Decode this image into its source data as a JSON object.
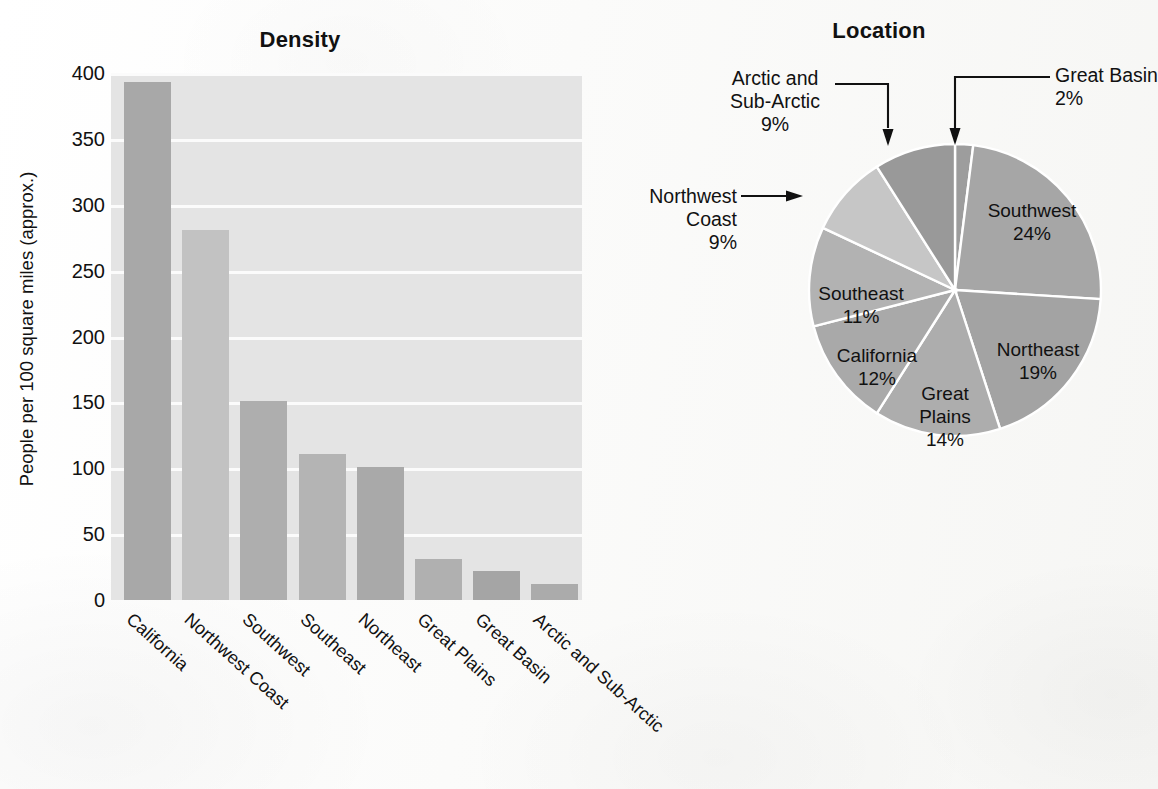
{
  "chart_data": [
    {
      "type": "bar",
      "title": "Density",
      "xlabel": "",
      "ylabel": "People per 100 square miles (approx.)",
      "ylim": [
        0,
        400
      ],
      "yticks": [
        0,
        50,
        100,
        150,
        200,
        250,
        300,
        350,
        400
      ],
      "ytick_labels": [
        "0",
        "50",
        "100",
        "150",
        "200",
        "250",
        "300",
        "350",
        "400"
      ],
      "grid": "horizontal-white",
      "legend": "none",
      "categories": [
        "California",
        "Northwest Coast",
        "Southwest",
        "Southeast",
        "Northeast",
        "Great Plains",
        "Great Basin",
        "Arctic and Sub-Arctic"
      ],
      "values": [
        393,
        281,
        151,
        111,
        101,
        31,
        22,
        12
      ],
      "bar_colors": [
        "#a8a8a8",
        "#c2c2c2",
        "#aeaeae",
        "#b4b4b4",
        "#a9a9a9",
        "#b0b0b0",
        "#a5a5a5",
        "#ababab"
      ],
      "plot_background": "#e4e4e4",
      "gridline_color": "#fbfbfb"
    },
    {
      "type": "pie",
      "title": "Location",
      "start_angle_deg": 0,
      "direction": "clockwise",
      "labels": [
        "Great Basin",
        "Southwest",
        "Northeast",
        "Great Plains",
        "California",
        "Southeast",
        "Northwest Coast",
        "Arctic and Sub-Arctic"
      ],
      "values": [
        2,
        24,
        19,
        14,
        12,
        11,
        9,
        9
      ],
      "value_labels": [
        "2%",
        "24%",
        "19%",
        "14%",
        "12%",
        "11%",
        "9%",
        "9%"
      ],
      "slice_colors": [
        "#9d9d9d",
        "#a6a6a6",
        "#a3a3a3",
        "#adadad",
        "#a9a9a9",
        "#b2b2b2",
        "#c6c6c6",
        "#999999"
      ],
      "separator_color": "#ffffff",
      "inside_labels": [
        "Southwest",
        "Northeast",
        "Great Plains",
        "California",
        "Southeast"
      ],
      "callout_labels": [
        "Great Basin",
        "Arctic and Sub-Arctic",
        "Northwest Coast"
      ]
    }
  ],
  "bar_chart": {
    "title": "Density",
    "ylabel": "People per 100 square miles (approx.)",
    "yticks": [
      "400",
      "350",
      "300",
      "250",
      "200",
      "150",
      "100",
      "50",
      "0"
    ],
    "categories": [
      "California",
      "Northwest Coast",
      "Southwest",
      "Southeast",
      "Northeast",
      "Great Plains",
      "Great Basin",
      "Arctic and Sub-Arctic"
    ]
  },
  "pie_chart": {
    "title": "Location",
    "slices": [
      {
        "label": "Great Basin",
        "percent": "2%",
        "value": 2
      },
      {
        "label": "Southwest",
        "percent": "24%",
        "value": 24
      },
      {
        "label": "Northeast",
        "percent": "19%",
        "value": 19
      },
      {
        "label": "Great Plains",
        "percent": "14%",
        "value": 14
      },
      {
        "label": "California",
        "percent": "12%",
        "value": 12
      },
      {
        "label": "Southeast",
        "percent": "11%",
        "value": 11
      },
      {
        "label": "Northwest Coast",
        "percent": "9%",
        "value": 9
      },
      {
        "label": "Arctic and Sub-Arctic",
        "percent": "9%",
        "value": 9
      }
    ],
    "callouts": {
      "great_basin": {
        "line1": "Great Basin",
        "line2": "2%"
      },
      "arctic": {
        "line1": "Arctic and",
        "line2": "Sub-Arctic",
        "line3": "9%"
      },
      "northwest_coast": {
        "line1": "Northwest",
        "line2": "Coast",
        "line3": "9%"
      }
    },
    "inside": {
      "southwest": {
        "line1": "Southwest",
        "line2": "24%"
      },
      "northeast": {
        "line1": "Northeast",
        "line2": "19%"
      },
      "great_plains": {
        "line1": "Great",
        "line2": "Plains",
        "line3": "14%"
      },
      "california": {
        "line1": "California",
        "line2": "12%"
      },
      "southeast": {
        "line1": "Southeast",
        "line2": "11%"
      }
    }
  }
}
